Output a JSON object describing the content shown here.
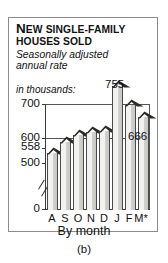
{
  "title": {
    "line1_lead": "N",
    "line1_lead_rest": "ew",
    "line1_rest": "single-family",
    "line2": "houses sold"
  },
  "subtitle": "Seasonally adjusted\nannual rate",
  "units_label": "in thousands:",
  "caption": "(b)",
  "colors": {
    "bar_face": "#f2f2f0",
    "bar_shade": "#c7c7c4",
    "roof": "#2b2b2b",
    "axis": "#3a3a3a",
    "grid": "#555555",
    "border": "#8c8c8c",
    "text": "#111111"
  },
  "chart_data": {
    "type": "bar",
    "title": "New single-family houses sold",
    "subtitle": "Seasonally adjusted annual rate",
    "xlabel": "By month",
    "ylabel": "in thousands:",
    "categories": [
      "A",
      "S",
      "O",
      "N",
      "D",
      "J",
      "F",
      "M*"
    ],
    "values": [
      558,
      590,
      612,
      620,
      623,
      755,
      700,
      666
    ],
    "point_labels": [
      "558",
      "",
      "",
      "",
      "",
      "755",
      "",
      "666"
    ],
    "ytick_labels": [
      "700",
      "600",
      "500",
      "0"
    ],
    "ytick_values": [
      700,
      600,
      500,
      0
    ],
    "ylim": [
      470,
      790
    ],
    "axis_break": true,
    "axis_break_between": [
      0,
      500
    ],
    "grid": "horizontal gridlines at 600 and 700",
    "legend": "none",
    "bar_style": "house-shaped bars with dark roof tops",
    "note": "M* indicates preliminary value"
  }
}
